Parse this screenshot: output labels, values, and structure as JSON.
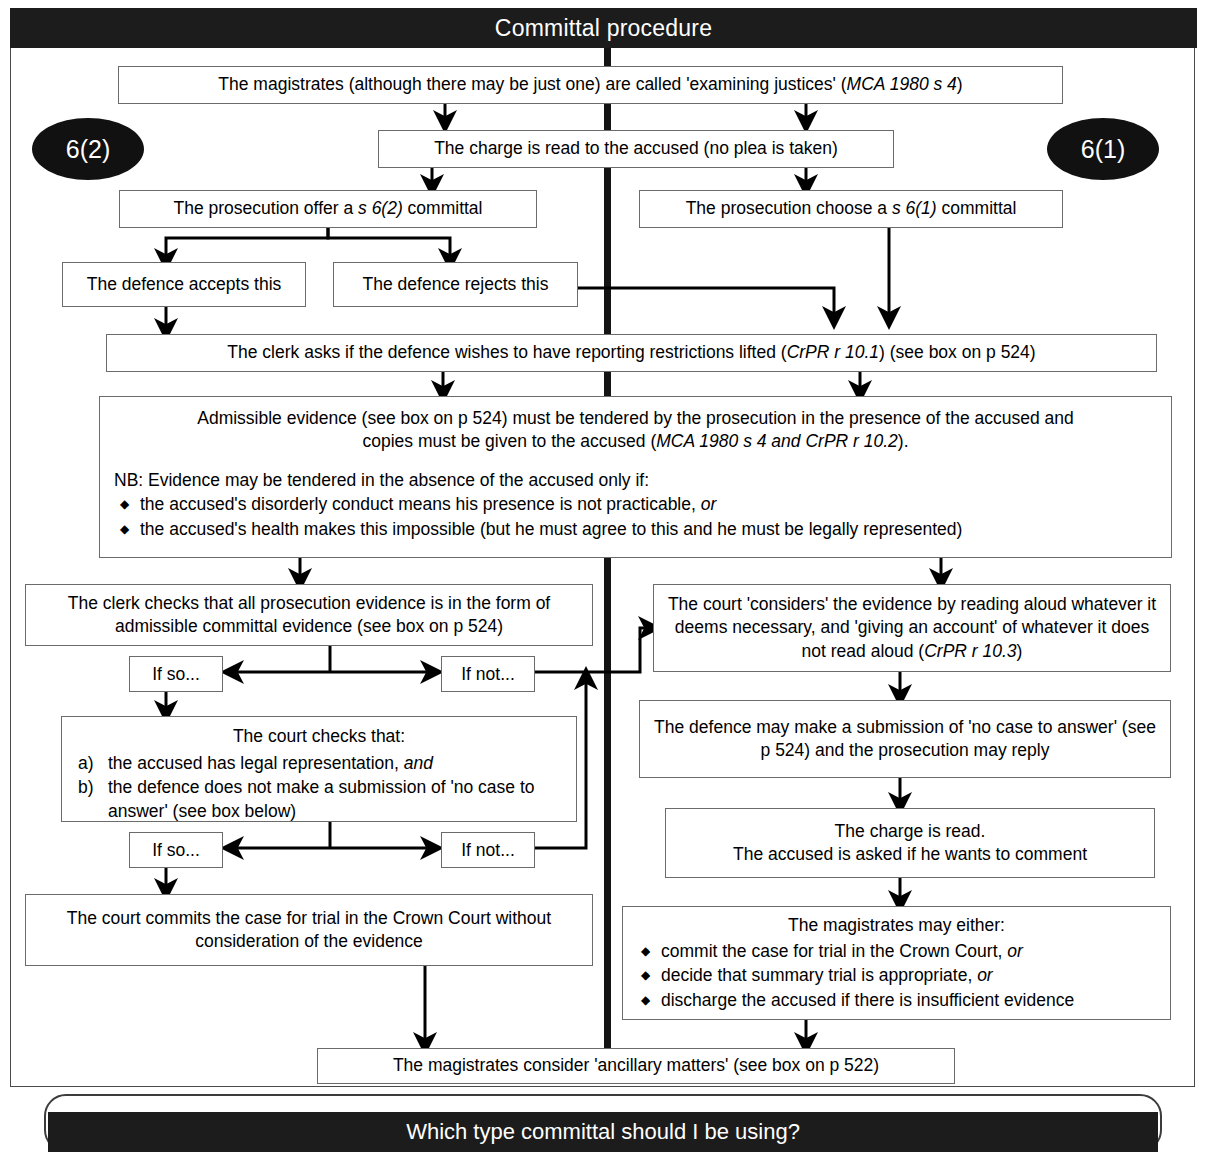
{
  "header": {
    "title": "Committal procedure"
  },
  "bubbles": {
    "left": "6(2)",
    "right": "6(1)"
  },
  "nodes": {
    "examining_justices": "The magistrates (although there may be just one) are called 'examining justices' (MCA 1980 s 4)",
    "examining_justices_plain": "The magistrates (although there may be just one) are called 'examining justices' (",
    "examining_justices_italic": "MCA 1980 s 4",
    "examining_justices_tail": ")",
    "charge_read": "The charge is read to the accused (no plea is taken)",
    "pros_offer_plain": "The prosecution offer a ",
    "pros_offer_italic": "s 6(2)",
    "pros_offer_tail": " committal",
    "pros_choose_plain": "The prosecution choose a ",
    "pros_choose_italic": "s 6(1)",
    "pros_choose_tail": " committal",
    "defence_accepts": "The defence accepts this",
    "defence_rejects": "The defence rejects this",
    "clerk_asks_plain": "The clerk asks if the defence wishes to have reporting restrictions lifted (",
    "clerk_asks_italic": "CrPR r 10.1",
    "clerk_asks_tail": ") (see box on p 524)",
    "admissible_line1": "Admissible evidence (see box on p 524) must be tendered by the prosecution in the presence of the accused and",
    "admissible_line2_plain": "copies must be given to the accused (",
    "admissible_line2_italic": "MCA 1980 s 4 and CrPR r 10.2",
    "admissible_line2_tail": ").",
    "admissible_nb": "NB: Evidence may be tendered in the absence of the accused only if:",
    "admissible_bullets": [
      {
        "text": "the accused's disorderly conduct means his presence is not practicable, ",
        "italic": "or"
      },
      {
        "text": "the accused's health makes this impossible (but he must agree to this and he must be legally represented)",
        "italic": ""
      }
    ],
    "clerk_checks": "The clerk checks that all prosecution evidence is in the form of admissible committal evidence (see box on p 524)",
    "court_considers_plain": "The court 'considers' the evidence by reading aloud whatever it deems necessary, and 'giving an account' of whatever it does not read aloud (",
    "court_considers_italic": "CrPR r 10.3",
    "court_considers_tail": ")",
    "if_so_1": "If so...",
    "if_not_1": "If not...",
    "if_so_2": "If so...",
    "if_not_2": "If not...",
    "court_checks_head": "The court checks that:",
    "court_checks_items": [
      {
        "label": "a)",
        "text": "the accused has legal representation, ",
        "italic": "and"
      },
      {
        "label": "b)",
        "text": "the defence does not make a submission of 'no case to answer' (see box below)",
        "italic": ""
      }
    ],
    "defence_submission": "The defence may make a submission of 'no case to answer' (see p 524) and the prosecution may reply",
    "charge_read_2_line1": "The charge is read.",
    "charge_read_2_line2": "The accused is asked if he wants to comment",
    "court_commits": "The court commits the case for trial in the Crown Court without consideration of the evidence",
    "magistrates_may_head": "The magistrates may either:",
    "magistrates_may_bullets": [
      {
        "text": "commit the case for trial in the Crown Court, ",
        "italic": "or"
      },
      {
        "text": "decide that summary trial is appropriate, ",
        "italic": "or"
      },
      {
        "text": "discharge the accused if there is insufficient evidence",
        "italic": ""
      }
    ],
    "ancillary": "The magistrates consider 'ancillary matters' (see box on p 522)"
  },
  "footer": {
    "banner": "Which type committal should I be using?"
  },
  "colors": {
    "banner_bg": "#1c1c1c",
    "banner_text": "#ffffff",
    "box_border": "#6b6b6b",
    "frame_border": "#4a4a4a",
    "connector": "#000000",
    "page_bg": "#ffffff"
  }
}
